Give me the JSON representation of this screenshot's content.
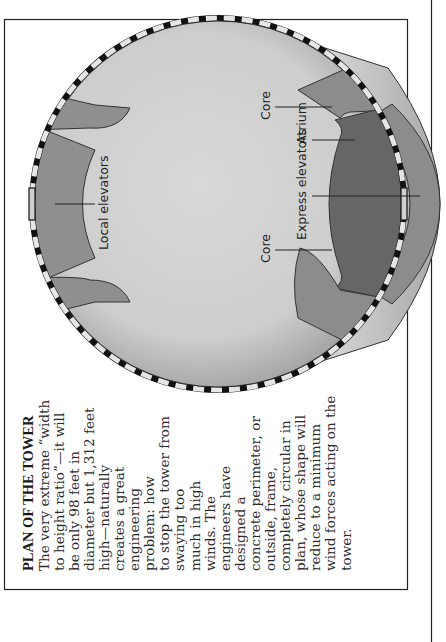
{
  "page": {
    "orientation": "rotated-90-ccw",
    "background": "#ffffff"
  },
  "caption": {
    "title": "PLAN OF THE TOWER",
    "lines": [
      "The very extreme “width",
      "to height ratio”—it will",
      "be only 98 feet in",
      "diameter but 1,312 feet",
      "high—naturally",
      "creates a great",
      "engineering",
      "problem: how",
      "to stop the tower from",
      "swaying too",
      "much in high",
      "winds. The",
      "engineers have",
      "designed a",
      "concrete perimeter, or",
      "outside, frame,",
      "completely circular in",
      "plan, whose shape will",
      "reduce to a minimum",
      "wind forces acting on the",
      "tower."
    ]
  },
  "diagram": {
    "labels": {
      "local_elevators": "Local elevators",
      "core_top": "Core",
      "core_bottom": "Core",
      "express_elevators": "Express elevators",
      "atrium": "Atrium"
    },
    "colors": {
      "floor_light": "#d6d6d6",
      "floor_edge": "#9a9a9a",
      "core": "#8e8e8e",
      "elevator_band": "#8a8a8a",
      "express": "#6a6a6a",
      "atrium": "#858585",
      "perimeter_dark": "#111111",
      "perimeter_light": "#e6e6e6"
    }
  }
}
